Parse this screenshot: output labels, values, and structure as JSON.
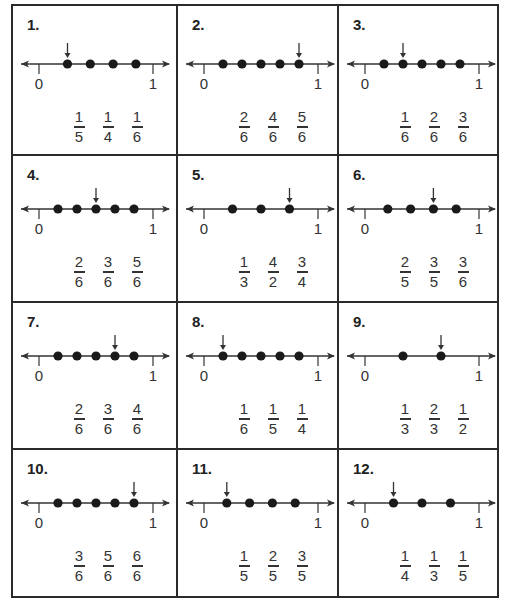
{
  "worksheet": {
    "line_labels": {
      "start": "0",
      "end": "1"
    },
    "problems": [
      {
        "number": "1.",
        "dots": [
          0.25,
          0.45,
          0.65,
          0.85
        ],
        "arrow_index": 0,
        "choices": [
          {
            "n": "1",
            "d": "5"
          },
          {
            "n": "1",
            "d": "4"
          },
          {
            "n": "1",
            "d": "6"
          }
        ]
      },
      {
        "number": "2.",
        "dots": [
          0.1667,
          0.3333,
          0.5,
          0.6667,
          0.8333
        ],
        "arrow_index": 4,
        "choices": [
          {
            "n": "2",
            "d": "6"
          },
          {
            "n": "4",
            "d": "6"
          },
          {
            "n": "5",
            "d": "6"
          }
        ]
      },
      {
        "number": "3.",
        "dots": [
          0.1667,
          0.3333,
          0.5,
          0.6667,
          0.8333
        ],
        "arrow_index": 1,
        "choices": [
          {
            "n": "1",
            "d": "6"
          },
          {
            "n": "2",
            "d": "6"
          },
          {
            "n": "3",
            "d": "6"
          }
        ]
      },
      {
        "number": "4.",
        "dots": [
          0.1667,
          0.3333,
          0.5,
          0.6667,
          0.8333
        ],
        "arrow_index": 2,
        "choices": [
          {
            "n": "2",
            "d": "6"
          },
          {
            "n": "3",
            "d": "6"
          },
          {
            "n": "5",
            "d": "6"
          }
        ]
      },
      {
        "number": "5.",
        "dots": [
          0.25,
          0.5,
          0.75
        ],
        "arrow_index": 2,
        "choices": [
          {
            "n": "1",
            "d": "3"
          },
          {
            "n": "4",
            "d": "2"
          },
          {
            "n": "3",
            "d": "4"
          }
        ]
      },
      {
        "number": "6.",
        "dots": [
          0.2,
          0.4,
          0.6,
          0.8
        ],
        "arrow_index": 2,
        "choices": [
          {
            "n": "2",
            "d": "5"
          },
          {
            "n": "3",
            "d": "5"
          },
          {
            "n": "3",
            "d": "6"
          }
        ]
      },
      {
        "number": "7.",
        "dots": [
          0.1667,
          0.3333,
          0.5,
          0.6667,
          0.8333
        ],
        "arrow_index": 3,
        "choices": [
          {
            "n": "2",
            "d": "6"
          },
          {
            "n": "3",
            "d": "6"
          },
          {
            "n": "4",
            "d": "6"
          }
        ]
      },
      {
        "number": "8.",
        "dots": [
          0.1667,
          0.3333,
          0.5,
          0.6667,
          0.8333
        ],
        "arrow_index": 0,
        "choices": [
          {
            "n": "1",
            "d": "6"
          },
          {
            "n": "1",
            "d": "5"
          },
          {
            "n": "1",
            "d": "4"
          }
        ]
      },
      {
        "number": "9.",
        "dots": [
          0.3333,
          0.6667
        ],
        "arrow_index": 1,
        "choices": [
          {
            "n": "1",
            "d": "3"
          },
          {
            "n": "2",
            "d": "3"
          },
          {
            "n": "1",
            "d": "2"
          }
        ]
      },
      {
        "number": "10.",
        "dots": [
          0.1667,
          0.3333,
          0.5,
          0.6667,
          0.8333
        ],
        "arrow_index": 4,
        "choices": [
          {
            "n": "3",
            "d": "6"
          },
          {
            "n": "5",
            "d": "6"
          },
          {
            "n": "6",
            "d": "6"
          }
        ]
      },
      {
        "number": "11.",
        "dots": [
          0.2,
          0.4,
          0.6,
          0.8
        ],
        "arrow_index": 0,
        "choices": [
          {
            "n": "1",
            "d": "5"
          },
          {
            "n": "2",
            "d": "5"
          },
          {
            "n": "3",
            "d": "5"
          }
        ]
      },
      {
        "number": "12.",
        "dots": [
          0.25,
          0.5,
          0.75
        ],
        "arrow_index": 0,
        "choices": [
          {
            "n": "1",
            "d": "4"
          },
          {
            "n": "1",
            "d": "3"
          },
          {
            "n": "1",
            "d": "5"
          }
        ]
      }
    ]
  }
}
